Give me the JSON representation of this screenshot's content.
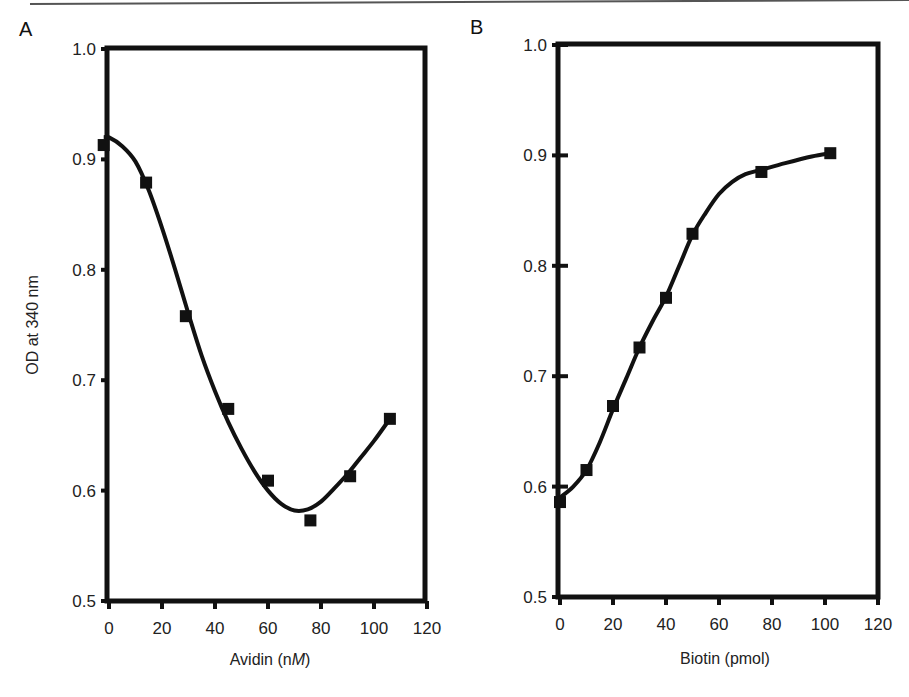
{
  "figure": {
    "top_rule_color": "#555555",
    "line_color": "#111111",
    "marker_color": "#111111"
  },
  "chart_data": [
    {
      "panel": "A",
      "type": "line",
      "title": "",
      "xlabel": "Avidin (nM)",
      "xlabel_parts": [
        "Avidin (n",
        "M",
        ")"
      ],
      "ylabel": "OD at 340 nm",
      "xlim": [
        0,
        120
      ],
      "ylim": [
        0.5,
        1.0
      ],
      "xticks": [
        0,
        20,
        40,
        60,
        80,
        100,
        120
      ],
      "yticks": [
        0.5,
        0.6,
        0.7,
        0.8,
        0.9,
        1.0
      ],
      "ytick_labels": [
        "0.5",
        "0.6",
        "0.7",
        "0.8",
        "0.9",
        "1.0"
      ],
      "grid": false,
      "legend": null,
      "marker": "filled-square",
      "series": [
        {
          "name": "OD at 340 nm",
          "x": [
            -2,
            14,
            29,
            45,
            60,
            76,
            91,
            106
          ],
          "y": [
            0.913,
            0.879,
            0.758,
            0.674,
            0.609,
            0.573,
            0.613,
            0.665
          ]
        }
      ],
      "fit_curve": {
        "x": [
          -2,
          0,
          5,
          10,
          15,
          20,
          25,
          30,
          35,
          40,
          45,
          50,
          55,
          60,
          65,
          70,
          75,
          80,
          85,
          90,
          95,
          100,
          106
        ],
        "y": [
          0.92,
          0.92,
          0.912,
          0.898,
          0.872,
          0.838,
          0.8,
          0.76,
          0.722,
          0.69,
          0.662,
          0.638,
          0.617,
          0.6,
          0.588,
          0.582,
          0.583,
          0.59,
          0.602,
          0.615,
          0.63,
          0.645,
          0.665
        ]
      }
    },
    {
      "panel": "B",
      "type": "line",
      "title": "",
      "xlabel": "Biotin (pmol)",
      "ylabel": "",
      "xlim": [
        0,
        120
      ],
      "ylim": [
        0.5,
        1.0
      ],
      "xticks": [
        0,
        20,
        40,
        60,
        80,
        100,
        120
      ],
      "yticks": [
        0.5,
        0.6,
        0.7,
        0.8,
        0.9,
        1.0
      ],
      "ytick_labels": [
        "0.5",
        "0.6",
        "0.7",
        "0.8",
        "0.9",
        "1.0"
      ],
      "grid": false,
      "legend": null,
      "marker": "filled-square",
      "series": [
        {
          "name": "OD at 340 nm",
          "x": [
            0,
            10,
            20,
            30,
            40,
            50,
            76,
            102
          ],
          "y": [
            0.586,
            0.615,
            0.673,
            0.726,
            0.771,
            0.829,
            0.885,
            0.902
          ]
        }
      ],
      "fit_curve": {
        "x": [
          0,
          5,
          10,
          15,
          20,
          25,
          30,
          35,
          40,
          45,
          50,
          55,
          60,
          65,
          70,
          76,
          85,
          95,
          102
        ],
        "y": [
          0.59,
          0.6,
          0.615,
          0.64,
          0.67,
          0.698,
          0.726,
          0.75,
          0.772,
          0.8,
          0.828,
          0.848,
          0.865,
          0.876,
          0.883,
          0.887,
          0.893,
          0.899,
          0.902
        ]
      }
    }
  ]
}
